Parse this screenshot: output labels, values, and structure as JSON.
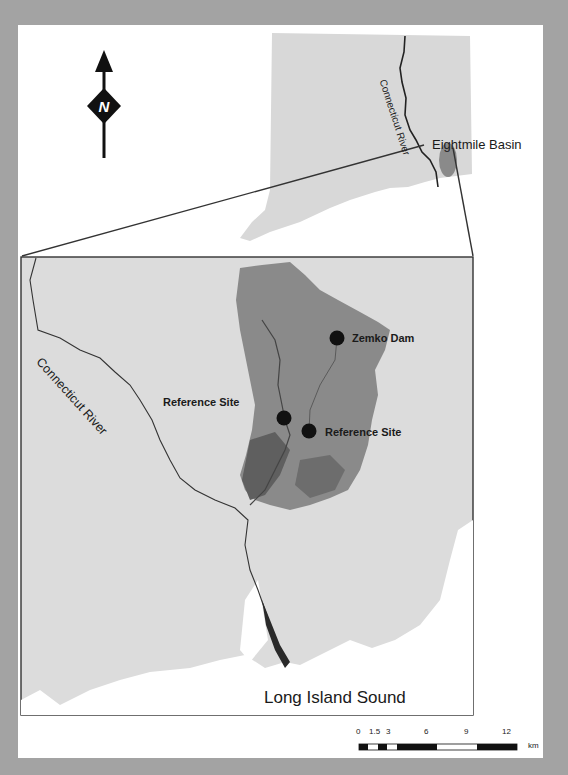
{
  "map": {
    "title": "Eightmile Basin location map",
    "colors": {
      "outer_border": "#a3a3a3",
      "panel": "#ffffff",
      "land": "#d8d8d8",
      "basin": "#8a8a8a",
      "basin_dark": "#5a5a5a",
      "river": "#222222",
      "frame": "#333333",
      "site_marker": "#111111"
    },
    "locator": {
      "basin_label": "Eightmile Basin",
      "river_label": "Connecticut River"
    },
    "inset": {
      "river_label": "Connecticut River",
      "water_label": "Long Island Sound",
      "sites": [
        {
          "name": "Zemko Dam",
          "x": 337,
          "y": 338
        },
        {
          "name": "Reference Site",
          "x": 284,
          "y": 418
        },
        {
          "name": "Reference Site",
          "x": 309,
          "y": 431
        }
      ]
    },
    "north_arrow": {
      "letter": "N",
      "icon": "north-arrow-icon"
    },
    "scale_bar": {
      "ticks": [
        "0",
        "1.5",
        "3",
        "6",
        "9",
        "12"
      ],
      "unit": "km"
    }
  }
}
